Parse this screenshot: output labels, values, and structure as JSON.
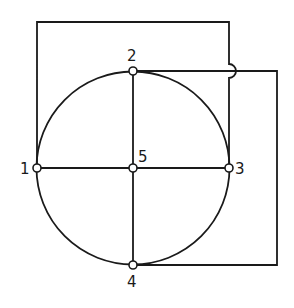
{
  "diagram": {
    "type": "graph",
    "stroke_color": "#1a1a1a",
    "background": "#ffffff",
    "nodes": [
      {
        "id": "1",
        "label": "1",
        "x": 37,
        "y": 168
      },
      {
        "id": "2",
        "label": "2",
        "x": 133,
        "y": 71
      },
      {
        "id": "3",
        "label": "3",
        "x": 229,
        "y": 168
      },
      {
        "id": "4",
        "label": "4",
        "x": 133,
        "y": 265
      },
      {
        "id": "5",
        "label": "5",
        "x": 133,
        "y": 168
      }
    ],
    "edges": [
      {
        "from": "1",
        "to": "2",
        "kind": "arc"
      },
      {
        "from": "2",
        "to": "3",
        "kind": "arc"
      },
      {
        "from": "3",
        "to": "4",
        "kind": "arc"
      },
      {
        "from": "4",
        "to": "1",
        "kind": "arc"
      },
      {
        "from": "1",
        "to": "5",
        "kind": "line"
      },
      {
        "from": "5",
        "to": "3",
        "kind": "line"
      },
      {
        "from": "2",
        "to": "5",
        "kind": "line"
      },
      {
        "from": "5",
        "to": "4",
        "kind": "line"
      },
      {
        "from": "1",
        "to": "3",
        "kind": "external-top-loop"
      },
      {
        "from": "2",
        "to": "4",
        "kind": "external-right-loop"
      }
    ]
  }
}
